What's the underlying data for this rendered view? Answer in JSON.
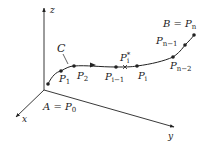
{
  "diagram": {
    "type": "space-curve-partition",
    "axes": {
      "x": {
        "label": "x"
      },
      "y": {
        "label": "y"
      },
      "z": {
        "label": "z"
      }
    },
    "curve": {
      "label": "C",
      "start_label": "A = P",
      "start_sub": "0",
      "end_label": "B = P",
      "end_sub": "n"
    },
    "points": [
      {
        "name": "P",
        "sub": "1"
      },
      {
        "name": "P",
        "sub": "2"
      },
      {
        "name": "P",
        "sub": "i−1"
      },
      {
        "name": "P",
        "sub": "i",
        "sup": "*"
      },
      {
        "name": "P",
        "sub": "i"
      },
      {
        "name": "P",
        "sub": "n−2"
      },
      {
        "name": "P",
        "sub": "n−1"
      }
    ],
    "colors": {
      "ink": "#222222",
      "background": "#ffffff"
    }
  }
}
